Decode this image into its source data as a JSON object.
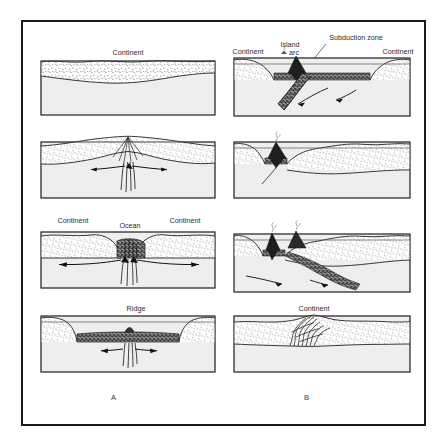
{
  "figure": {
    "column_labels": [
      {
        "id": "a",
        "text": "A"
      },
      {
        "id": "b",
        "text": "B"
      }
    ],
    "colors": {
      "frame": "#1a1a1a",
      "continental_crust_fill": "#ffffff",
      "continental_crust_stipple": "#3a3a3a",
      "mantle_fill": "#eeeeee",
      "oceanic_crust_fill": "#4a4a4a",
      "outline": "#222222",
      "background": "#ffffff",
      "label_text": "#2b2b2b"
    },
    "panels": [
      {
        "id": "a1",
        "column": "A",
        "row": 1,
        "caption": "Stable continental crust over mantle",
        "labels": [
          {
            "name": "continent-label",
            "text": "Continent",
            "x": 95,
            "y": 9,
            "anchor": "middle"
          }
        ],
        "features": {
          "sea_level_line": false,
          "oceanic_crust": false,
          "upwelling": false,
          "arrows": 0,
          "volcanoes": 0,
          "subducting_slab": false,
          "folded_mountains": false
        }
      },
      {
        "id": "a2",
        "column": "A",
        "row": 2,
        "caption": "Continental rifting with mantle upwelling and divergent flow",
        "labels": [],
        "features": {
          "sea_level_line": false,
          "oceanic_crust": false,
          "upwelling": true,
          "arrows": 3,
          "volcanoes": 0,
          "subducting_slab": false,
          "folded_mountains": false
        }
      },
      {
        "id": "a3",
        "column": "A",
        "row": 3,
        "caption": "Continental separation forming a young ocean basin",
        "labels": [
          {
            "name": "continent-left-label",
            "text": "Continent",
            "x": 40,
            "y": 9,
            "anchor": "middle"
          },
          {
            "name": "ocean-label",
            "text": "Ocean",
            "x": 97,
            "y": 14,
            "anchor": "middle"
          },
          {
            "name": "continent-right-label",
            "text": "Continent",
            "x": 152,
            "y": 9,
            "anchor": "middle"
          }
        ],
        "features": {
          "sea_level_line": false,
          "oceanic_crust": true,
          "upwelling": true,
          "arrows": 4,
          "volcanoes": 0,
          "subducting_slab": false,
          "folded_mountains": false
        }
      },
      {
        "id": "a4",
        "column": "A",
        "row": 4,
        "caption": "Mature ocean basin with mid-ocean ridge spreading centre",
        "labels": [
          {
            "name": "ridge-label",
            "text": "Ridge",
            "x": 103,
            "y": 9,
            "anchor": "middle"
          }
        ],
        "features": {
          "sea_level_line": true,
          "oceanic_crust": true,
          "upwelling": true,
          "arrows": 2,
          "volcanoes": 0,
          "subducting_slab": false,
          "folded_mountains": false
        }
      },
      {
        "id": "b1",
        "column": "B",
        "row": 1,
        "caption": "Ocean basin closing; island arc above subduction zone",
        "labels": [
          {
            "name": "continent-left-label",
            "text": "Continent",
            "x": 22,
            "y": 19,
            "anchor": "middle"
          },
          {
            "name": "island-label",
            "text": "Island",
            "x": 62,
            "y": 12,
            "anchor": "middle"
          },
          {
            "name": "arc-label",
            "text": "arc",
            "x": 65,
            "y": 20,
            "anchor": "middle"
          },
          {
            "name": "subduction-zone-label",
            "text": "Subduction zone",
            "x": 130,
            "y": 7,
            "anchor": "middle"
          },
          {
            "name": "continent-right-label",
            "text": "Continent",
            "x": 172,
            "y": 19,
            "anchor": "middle"
          }
        ],
        "features": {
          "sea_level_line": true,
          "oceanic_crust": true,
          "upwelling": false,
          "arrows": 2,
          "volcanoes": 1,
          "subducting_slab": true,
          "folded_mountains": false,
          "leader_line": true
        }
      },
      {
        "id": "b2",
        "column": "B",
        "row": 2,
        "caption": "Ocean narrowing; arc volcano approaching continental margin",
        "labels": [],
        "features": {
          "sea_level_line": true,
          "oceanic_crust": true,
          "upwelling": false,
          "arrows": 0,
          "volcanoes": 1,
          "subducting_slab": true,
          "folded_mountains": false
        }
      },
      {
        "id": "b3",
        "column": "B",
        "row": 3,
        "caption": "Arc-continent collision with twin volcanoes and descending slab",
        "labels": [],
        "features": {
          "sea_level_line": true,
          "oceanic_crust": true,
          "upwelling": false,
          "arrows": 2,
          "volcanoes": 2,
          "subducting_slab": true,
          "folded_mountains": false
        }
      },
      {
        "id": "b4",
        "column": "B",
        "row": 4,
        "caption": "Suturing complete; folded mountain belt within single continent",
        "labels": [
          {
            "name": "continent-label",
            "text": "Continent",
            "x": 95,
            "y": 9,
            "anchor": "middle"
          }
        ],
        "features": {
          "sea_level_line": false,
          "oceanic_crust": false,
          "upwelling": false,
          "arrows": 0,
          "volcanoes": 0,
          "subducting_slab": false,
          "folded_mountains": true
        }
      }
    ]
  }
}
